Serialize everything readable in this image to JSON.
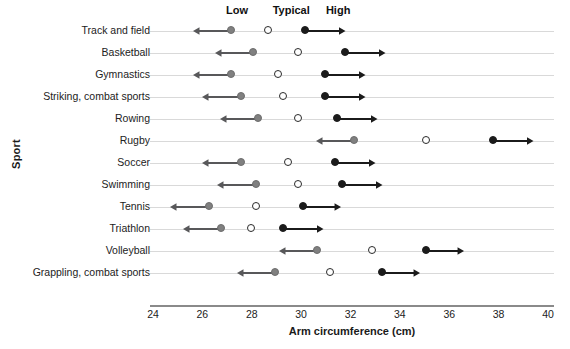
{
  "chart_data": {
    "type": "scatter",
    "title": "",
    "xlabel": "Arm circumference (cm)",
    "ylabel": "Sport",
    "xlim": [
      24,
      40
    ],
    "xticks": [
      24,
      26,
      28,
      30,
      32,
      34,
      36,
      38,
      40
    ],
    "xticklabels": [
      "24",
      "26",
      "28",
      "30",
      "32",
      "34",
      "36",
      "38",
      "40"
    ],
    "grid": true,
    "legend_position": "top",
    "column_headers": [
      {
        "label": "Low",
        "x": 27.4
      },
      {
        "label": "Typical",
        "x": 29.6
      },
      {
        "label": "High",
        "x": 31.5
      }
    ],
    "series": [
      {
        "name": "Low",
        "marker": "filled-circle",
        "color": "#808080",
        "arrow": "left"
      },
      {
        "name": "Typical",
        "marker": "open-circle",
        "color": "#ffffff",
        "arrow": "none"
      },
      {
        "name": "High",
        "marker": "filled-circle",
        "color": "#1b1b1b",
        "arrow": "right"
      }
    ],
    "categories": [
      "Track and field",
      "Basketball",
      "Gymnastics",
      "Striking, combat sports",
      "Rowing",
      "Rugby",
      "Soccer",
      "Swimming",
      "Tennis",
      "Triathlon",
      "Volleyball",
      "Grappling, combat sports"
    ],
    "rows": [
      {
        "category": "Track and field",
        "low": 27.2,
        "typical": 28.7,
        "high": 30.2,
        "low_arrow_end": 25.6,
        "high_arrow_end": 31.8
      },
      {
        "category": "Basketball",
        "low": 28.1,
        "typical": 29.9,
        "high": 31.8,
        "low_arrow_end": 26.5,
        "high_arrow_end": 33.4
      },
      {
        "category": "Gymnastics",
        "low": 27.2,
        "typical": 29.1,
        "high": 31.0,
        "low_arrow_end": 25.6,
        "high_arrow_end": 32.6
      },
      {
        "category": "Striking, combat sports",
        "low": 27.6,
        "typical": 29.3,
        "high": 31.0,
        "low_arrow_end": 26.0,
        "high_arrow_end": 32.6
      },
      {
        "category": "Rowing",
        "low": 28.3,
        "typical": 29.9,
        "high": 31.5,
        "low_arrow_end": 26.7,
        "high_arrow_end": 33.1
      },
      {
        "category": "Rugby",
        "low": 32.2,
        "typical": 35.1,
        "high": 37.8,
        "low_arrow_end": 30.6,
        "high_arrow_end": 39.4
      },
      {
        "category": "Soccer",
        "low": 27.6,
        "typical": 29.5,
        "high": 31.4,
        "low_arrow_end": 26.0,
        "high_arrow_end": 33.0
      },
      {
        "category": "Swimming",
        "low": 28.2,
        "typical": 29.9,
        "high": 31.7,
        "low_arrow_end": 26.6,
        "high_arrow_end": 33.3
      },
      {
        "category": "Tennis",
        "low": 26.3,
        "typical": 28.2,
        "high": 30.1,
        "low_arrow_end": 24.7,
        "high_arrow_end": 31.6
      },
      {
        "category": "Triathlon",
        "low": 26.8,
        "typical": 28.0,
        "high": 29.3,
        "low_arrow_end": 25.2,
        "high_arrow_end": 30.9
      },
      {
        "category": "Volleyball",
        "low": 30.7,
        "typical": 32.9,
        "high": 35.1,
        "low_arrow_end": 29.1,
        "high_arrow_end": 36.6
      },
      {
        "category": "Grappling, combat sports",
        "low": 29.0,
        "typical": 31.2,
        "high": 33.3,
        "low_arrow_end": 27.4,
        "high_arrow_end": 34.8
      }
    ]
  }
}
